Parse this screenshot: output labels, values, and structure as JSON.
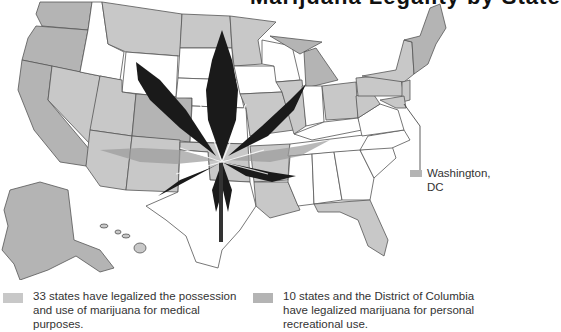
{
  "title": "Marijuana Legality by State",
  "colors": {
    "medical": "#c8c8c8",
    "recreational": "#b4b4b4",
    "illegal": "#ffffff",
    "border": "#555555",
    "leaf_dark": "#1a1a1a",
    "leaf_gray": "#9a9a9a"
  },
  "legend": {
    "medical": {
      "line1": "33 states have legalized the possession",
      "line2": "and use of marijuana for medical",
      "line3": "purposes."
    },
    "recreational": {
      "line1": "10 states and the District of Columbia",
      "line2": "have legalized marijuana for personal",
      "line3": "recreational use."
    }
  },
  "callout": {
    "line1": "Washington,",
    "line2": "DC"
  }
}
